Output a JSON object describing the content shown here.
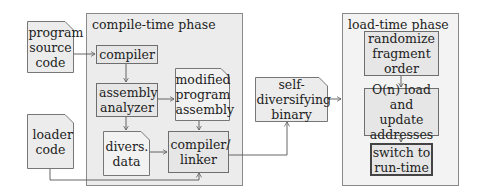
{
  "phases": {
    "compile": {
      "label": "compile-time phase"
    },
    "load": {
      "label": "load-time phase"
    }
  },
  "inputs": {
    "program_source": "program source code",
    "loader_code": "loader code"
  },
  "compile_nodes": {
    "compiler": "compiler",
    "assembly_analyzer": "assembly analyzer",
    "modified_assembly": "modified program assembly",
    "divers_data": "divers. data",
    "compiler_linker": "compiler/ linker"
  },
  "output": {
    "binary": "self-diversifying binary"
  },
  "load_nodes": {
    "randomize": "randomize fragment order",
    "load_update": "O(n) load and update addresses",
    "switch": "switch to run-time"
  },
  "colors": {
    "compile_phase_fill": "#ececec",
    "load_phase_fill": "#f3f3f3",
    "box_fill": "#e6e6e6",
    "line": "#555555"
  }
}
